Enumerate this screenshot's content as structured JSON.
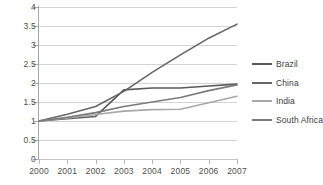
{
  "chart_data": {
    "type": "line",
    "title": "",
    "xlabel": "",
    "ylabel": "",
    "x": [
      2000,
      2001,
      2002,
      2003,
      2004,
      2005,
      2006,
      2007
    ],
    "xticklabels": [
      "2000",
      "2001",
      "2002",
      "2003",
      "2004",
      "2005",
      "2006",
      "2007"
    ],
    "yticklabels": [
      "0",
      "0.5",
      "1",
      "1.5",
      "2",
      "2.5",
      "3",
      "3.5",
      "4"
    ],
    "yticks": [
      0,
      0.5,
      1,
      1.5,
      2,
      2.5,
      3,
      3.5,
      4
    ],
    "ylim": [
      0,
      4
    ],
    "xlim": [
      2000,
      2007
    ],
    "grid": "horizontal",
    "legend_position": "right",
    "series": [
      {
        "name": "Brazil",
        "color": "#5a5a5a",
        "values": [
          1.0,
          1.06,
          1.12,
          1.82,
          1.87,
          1.87,
          1.92,
          1.97
        ]
      },
      {
        "name": "China",
        "color": "#666666",
        "values": [
          1.0,
          1.18,
          1.38,
          1.78,
          2.28,
          2.74,
          3.18,
          3.55
        ]
      },
      {
        "name": "India",
        "color": "#a8a8a8",
        "values": [
          1.0,
          1.08,
          1.17,
          1.26,
          1.3,
          1.31,
          1.48,
          1.65
        ]
      },
      {
        "name": "South Africa",
        "color": "#7a7a7a",
        "values": [
          1.0,
          1.1,
          1.22,
          1.38,
          1.5,
          1.62,
          1.8,
          1.95
        ]
      }
    ]
  },
  "legend": {
    "items": [
      {
        "label": "Brazil"
      },
      {
        "label": "China"
      },
      {
        "label": "India"
      },
      {
        "label": "South Africa"
      }
    ]
  }
}
